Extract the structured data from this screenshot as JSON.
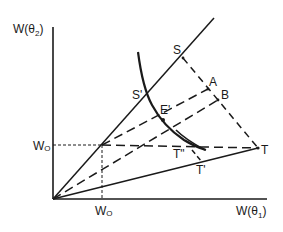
{
  "axes": {
    "y_label": "W(θ",
    "y_label_sub": "2",
    "y_label_close": ")",
    "x_label": "W(θ",
    "x_label_sub": "1",
    "x_label_close": ")",
    "w0_x_label": "W",
    "w0_x_sub": "O",
    "w0_y_label": "W",
    "w0_y_sub": "O"
  },
  "points": {
    "S": "S",
    "S_prime": "S'",
    "A": "A",
    "B": "B",
    "E_prime": "E'",
    "T": "T",
    "T_double_prime": "T\"",
    "T_prime": "T'"
  },
  "colors": {
    "ink": "#1a1a1a",
    "background": "#ffffff"
  }
}
